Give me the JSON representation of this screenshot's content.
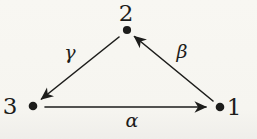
{
  "diagram": {
    "nodes": [
      {
        "id": "2",
        "label": "2",
        "position": "top"
      },
      {
        "id": "3",
        "label": "3",
        "position": "bottom-left"
      },
      {
        "id": "1",
        "label": "1",
        "position": "bottom-right"
      }
    ],
    "edges": [
      {
        "label": "γ",
        "from": "2",
        "to": "3",
        "direction": "top to bottom-left"
      },
      {
        "label": "β",
        "from": "1",
        "to": "2",
        "direction": "bottom-right to top"
      },
      {
        "label": "α",
        "from": "3",
        "to": "1",
        "direction": "bottom-left to bottom-right"
      }
    ],
    "colors": {
      "ink": "#1d1d1b",
      "paper": "#f7f6f1"
    }
  }
}
